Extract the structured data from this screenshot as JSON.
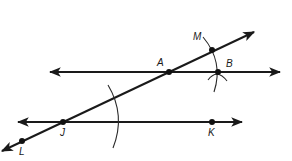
{
  "diagram": {
    "type": "geometry-construction",
    "colors": {
      "ink": "#1a1a1a",
      "background": "#ffffff"
    },
    "lines": [
      {
        "id": "upper-line",
        "through": [
          "A",
          "B"
        ],
        "from": [
          50,
          72
        ],
        "to": [
          280,
          72
        ],
        "arrows": "both"
      },
      {
        "id": "lower-line",
        "through": [
          "J",
          "K"
        ],
        "from": [
          18,
          122
        ],
        "to": [
          242,
          122
        ],
        "arrows": "both"
      },
      {
        "id": "transversal",
        "through": [
          "L",
          "J",
          "A",
          "M"
        ],
        "from": [
          2,
          151
        ],
        "to": [
          254,
          32
        ],
        "arrows": "both"
      }
    ],
    "points": [
      {
        "id": "A",
        "label": "A",
        "x": 169,
        "y": 72,
        "label_x": 157,
        "label_y": 66
      },
      {
        "id": "B",
        "label": "B",
        "x": 218,
        "y": 72,
        "label_x": 226,
        "label_y": 67
      },
      {
        "id": "M",
        "label": "M",
        "x": 212,
        "y": 50,
        "label_x": 193,
        "label_y": 40
      },
      {
        "id": "J",
        "label": "J",
        "x": 63,
        "y": 122,
        "label_x": 60,
        "label_y": 136
      },
      {
        "id": "K",
        "label": "K",
        "x": 212,
        "y": 122,
        "label_x": 208,
        "label_y": 136
      },
      {
        "id": "L",
        "label": "L",
        "x": 22,
        "y": 141,
        "label_x": 19,
        "label_y": 155
      }
    ],
    "arcs": [
      {
        "id": "arc-at-J",
        "path": "M 108 85 Q 126 115 113 148"
      },
      {
        "id": "arc-at-A",
        "path": "M 203 37 Q 224 62 214 92"
      },
      {
        "id": "arc-cross-B",
        "path": "M 208 80 Q 217 68 227 81"
      }
    ]
  }
}
